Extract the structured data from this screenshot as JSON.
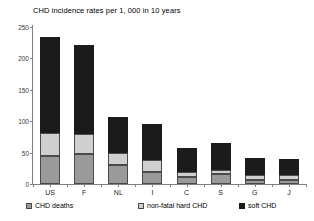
{
  "chart_data": {
    "type": "bar",
    "subtype": "stacked-bar",
    "title": "CHD incidence rates per 1, 000 in 10 years",
    "xlabel": "",
    "ylabel": "",
    "ylim": [
      0,
      250
    ],
    "yticks": [
      0,
      50,
      100,
      150,
      200,
      250
    ],
    "ytick_labels": [
      "0",
      "50",
      "100",
      "150",
      "200",
      "250"
    ],
    "grid": false,
    "legend_position": "bottom",
    "categories": [
      "US",
      "F",
      "NL",
      "I",
      "C",
      "S",
      "G",
      "J"
    ],
    "series": [
      {
        "name": "CHD deaths",
        "color": "#9a9a9a",
        "values": [
          45,
          47,
          31,
          19,
          11,
          16,
          6,
          6
        ]
      },
      {
        "name": "non-fatal hard CHD",
        "color": "#cfcfcf",
        "values": [
          36,
          33,
          19,
          19,
          8,
          6,
          8,
          9
        ]
      },
      {
        "name": "soft CHD",
        "color": "#1b1b1b",
        "values": [
          153,
          141,
          56,
          58,
          39,
          43,
          28,
          25
        ]
      }
    ],
    "totals": [
      234,
      221,
      106,
      96,
      58,
      65,
      42,
      40
    ]
  },
  "legend": {
    "items": [
      {
        "label": "CHD deaths",
        "swatch_name": "legend-swatch-chd-deaths"
      },
      {
        "label": "non-fatal hard CHD",
        "swatch_name": "legend-swatch-non-fatal-hard-chd"
      },
      {
        "label": "soft CHD",
        "swatch_name": "legend-swatch-soft-chd"
      }
    ]
  }
}
